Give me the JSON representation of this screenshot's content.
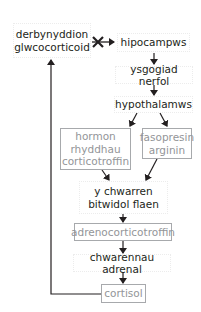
{
  "diagram": {
    "title": "",
    "nodes": {
      "receptors": "derbynyddion glwcocorticoid",
      "hippocampus": "hipocampws",
      "nerve_stimulus": "ysgogiad nerfol",
      "hypothalamus": "hypothalamws",
      "crh": "hormon rhyddhau corticotroffin",
      "avp": "fasopresin arginin",
      "pituitary": "y chwarren bitwidol flaen",
      "acth": "adrenocorticotroffin",
      "adrenal": "chwarennau adrenal",
      "cortisol": "cortisol"
    },
    "edges": [
      {
        "from": "receptors",
        "to": "hippocampus",
        "type": "inhibit"
      },
      {
        "from": "hippocampus",
        "to": "nerve_stimulus",
        "type": "arrow"
      },
      {
        "from": "nerve_stimulus",
        "to": "hypothalamus",
        "type": "arrow"
      },
      {
        "from": "hypothalamus",
        "to": "crh",
        "type": "arrow"
      },
      {
        "from": "hypothalamus",
        "to": "avp",
        "type": "arrow"
      },
      {
        "from": "crh",
        "to": "pituitary",
        "type": "arrow"
      },
      {
        "from": "avp",
        "to": "pituitary",
        "type": "arrow"
      },
      {
        "from": "pituitary",
        "to": "acth",
        "type": "arrow"
      },
      {
        "from": "acth",
        "to": "adrenal",
        "type": "arrow"
      },
      {
        "from": "adrenal",
        "to": "cortisol",
        "type": "arrow"
      },
      {
        "from": "cortisol",
        "to": "receptors",
        "type": "feedback"
      }
    ],
    "colors": {
      "line": "#231f20",
      "hormone_border": "#a7a9ac",
      "hormone_text": "#939598",
      "text": "#231f20"
    }
  }
}
